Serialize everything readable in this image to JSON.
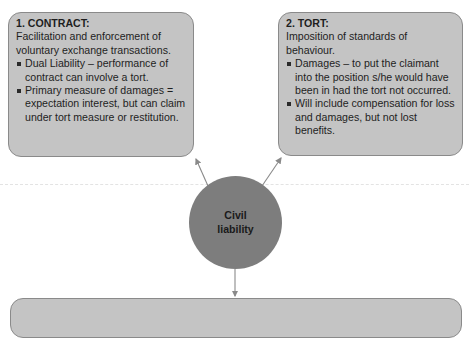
{
  "diagram": {
    "center": {
      "label": "Civil liability"
    },
    "nodes": [
      {
        "id": "contract",
        "title": "1. CONTRACT:",
        "intro": "Facilitation and enforcement of voluntary exchange transactions.",
        "bullets": [
          "Dual Liability – performance of contract can involve a tort.",
          "Primary measure of damages = expectation interest, but can claim under tort measure or restitution."
        ]
      },
      {
        "id": "tort",
        "title": "2. TORT:",
        "intro": "Imposition of standards of behaviour.",
        "bullets": [
          "Damages – to put the claimant into the position s/he would have been in had the tort not occurred.",
          "Will include compensation for loss and damages, but not lost benefits."
        ]
      },
      {
        "id": "third",
        "title": "",
        "intro": "",
        "bullets": []
      }
    ],
    "edges": [
      {
        "from": "Civil liability",
        "to": "1. CONTRACT:"
      },
      {
        "from": "Civil liability",
        "to": "2. TORT:"
      },
      {
        "from": "Civil liability",
        "to": "bottom box (cropped)"
      }
    ],
    "colors": {
      "box_fill": "#c4c4c4",
      "box_border": "#8a8a8a",
      "circle_fill": "#7d7d7d",
      "arrow": "#8a8a8a",
      "text": "#1e1e1e"
    }
  }
}
